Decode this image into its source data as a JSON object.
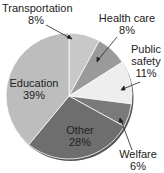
{
  "chart_data": {
    "type": "pie",
    "title": "",
    "categories": [
      "Transportation",
      "Health care",
      "Public safety",
      "Welfare",
      "Other",
      "Education"
    ],
    "values": [
      8,
      8,
      11,
      6,
      28,
      39
    ],
    "unit": "%",
    "colors": [
      "#c8c8c8",
      "#9a9a9a",
      "#eeeeee",
      "#7a7a7a",
      "#6e6e6e",
      "#bdbdbd"
    ],
    "start_angle_deg": -90,
    "direction": "clockwise",
    "labels": [
      {
        "name": "Transportation",
        "pct": "8%"
      },
      {
        "name": "Health care",
        "pct": "8%"
      },
      {
        "name": "Public",
        "name2": "safety",
        "pct": "11%"
      },
      {
        "name": "Welfare",
        "pct": "6%"
      },
      {
        "name": "Other",
        "pct": "28%"
      },
      {
        "name": "Education",
        "pct": "39%"
      }
    ]
  }
}
